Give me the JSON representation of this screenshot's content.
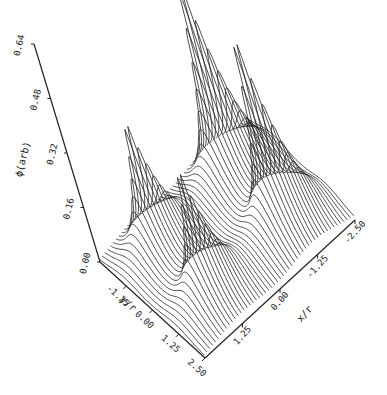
{
  "chart_data": {
    "type": "surface-3d-wireframe",
    "title": "",
    "zlabel": "ϕ(arb)",
    "xlabel": "x/r",
    "ylabel": "y/r",
    "zlim": [
      0.0,
      0.64
    ],
    "xlim": [
      -2.5,
      2.5
    ],
    "ylim": [
      -2.5,
      2.5
    ],
    "z_ticks": [
      "0.00",
      "0.16",
      "0.32",
      "0.48",
      "0.64"
    ],
    "z_tick_values": [
      0.0,
      0.16,
      0.32,
      0.48,
      0.64
    ],
    "x_ticks": [
      "1.25",
      "0.00",
      "-1.25",
      "-2.50"
    ],
    "x_tick_values": [
      1.25,
      0.0,
      -1.25,
      -2.5
    ],
    "y_ticks": [
      "-1.25",
      "0.00",
      "1.25",
      "2.50"
    ],
    "y_tick_values": [
      -1.25,
      0.0,
      1.25,
      2.5
    ],
    "peaks": [
      {
        "x": 1.25,
        "y": -1.25,
        "z": 0.4
      },
      {
        "x": 1.25,
        "y": 1.25,
        "z": 0.4
      },
      {
        "x": -1.25,
        "y": -1.25,
        "z": 0.64
      },
      {
        "x": -1.25,
        "y": 1.25,
        "z": 0.6
      }
    ],
    "line_color": "#222222",
    "grid": false,
    "legend": "none"
  }
}
